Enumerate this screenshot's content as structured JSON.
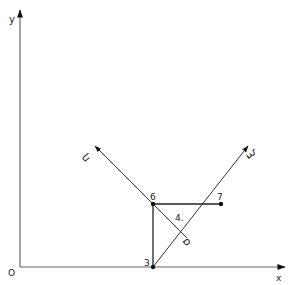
{
  "figure": {
    "axes": {
      "x_label": "x",
      "y_label": "y",
      "origin_label": "O"
    },
    "local_axes": {
      "eta_label": "η",
      "xi_label": "ξ"
    },
    "nodes": [
      {
        "id": "3",
        "label": "3"
      },
      {
        "id": "6",
        "label": "6"
      },
      {
        "id": "7",
        "label": "7"
      }
    ],
    "element_label": "4.",
    "sigma_label": "σ",
    "colors": {
      "line": "#2a2a2a",
      "axis": "#555555",
      "background": "#ffffff"
    }
  }
}
